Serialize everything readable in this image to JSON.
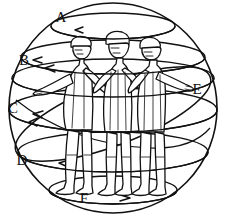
{
  "figure": {
    "background_color": "#ffffff",
    "line_color": "#111111",
    "width": 226,
    "height": 217,
    "figure_count": 3
  },
  "sphere": {
    "name": "celestial-sphere",
    "center_x": 113,
    "center_y": 108,
    "radius_x": 104,
    "radius_y": 105
  },
  "labels": [
    {
      "id": "A",
      "text": "A",
      "x": 61,
      "y": 22,
      "circle": "top-latitude",
      "arrow_direction": "left"
    },
    {
      "id": "B",
      "text": "B",
      "x": 24,
      "y": 65,
      "circle": "upper-latitude",
      "arrow_direction": "left"
    },
    {
      "id": "C",
      "text": "C",
      "x": 12,
      "y": 112,
      "circle": "tilted-great-circle",
      "arrow_direction": "left"
    },
    {
      "id": "D",
      "text": "D",
      "x": 22,
      "y": 165,
      "circle": "lower-latitude",
      "arrow_direction": "left"
    },
    {
      "id": "E",
      "text": "E",
      "x": 196,
      "y": 93,
      "circle": "equator",
      "arrow_direction": "right"
    },
    {
      "id": "F",
      "text": "F",
      "x": 84,
      "y": 202,
      "circle": "bottom-latitude",
      "arrow_direction": "right"
    }
  ],
  "latitude_circles": [
    {
      "name": "top-latitude",
      "cy": 26,
      "rx": 62,
      "ry": 13
    },
    {
      "name": "upper-latitude",
      "cy": 57,
      "rx": 92,
      "ry": 17
    },
    {
      "name": "mid-upper-latitude",
      "cy": 78,
      "rx": 101,
      "ry": 19
    },
    {
      "name": "equator",
      "cy": 110,
      "rx": 104,
      "ry": 22
    },
    {
      "name": "lower-latitude",
      "cy": 152,
      "rx": 95,
      "ry": 20
    },
    {
      "name": "bottom-latitude",
      "cy": 190,
      "rx": 64,
      "ry": 14
    }
  ],
  "tilted_circle": {
    "name": "oblique-great-circle",
    "rotation_deg": -22,
    "rx": 104,
    "ry": 30
  },
  "caption": ""
}
